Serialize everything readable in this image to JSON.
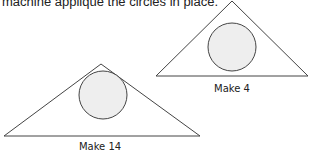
{
  "caption": "machine appliqué the circles in place.",
  "figures": [
    {
      "label": "Make 4",
      "triangle": {
        "apex": [
          232,
          1
        ],
        "left": [
          156,
          76
        ],
        "right": [
          308,
          76
        ]
      },
      "circle": {
        "cx": 232,
        "cy": 47,
        "r": 24
      }
    },
    {
      "label": "Make 14",
      "triangle": {
        "apex": [
          101,
          64
        ],
        "left": [
          4,
          136
        ],
        "right": [
          200,
          136
        ]
      },
      "circle": {
        "cx": 103,
        "cy": 95,
        "r": 24
      }
    }
  ],
  "colors": {
    "stroke": "#444444",
    "circle_fill": "#eeeeee"
  }
}
